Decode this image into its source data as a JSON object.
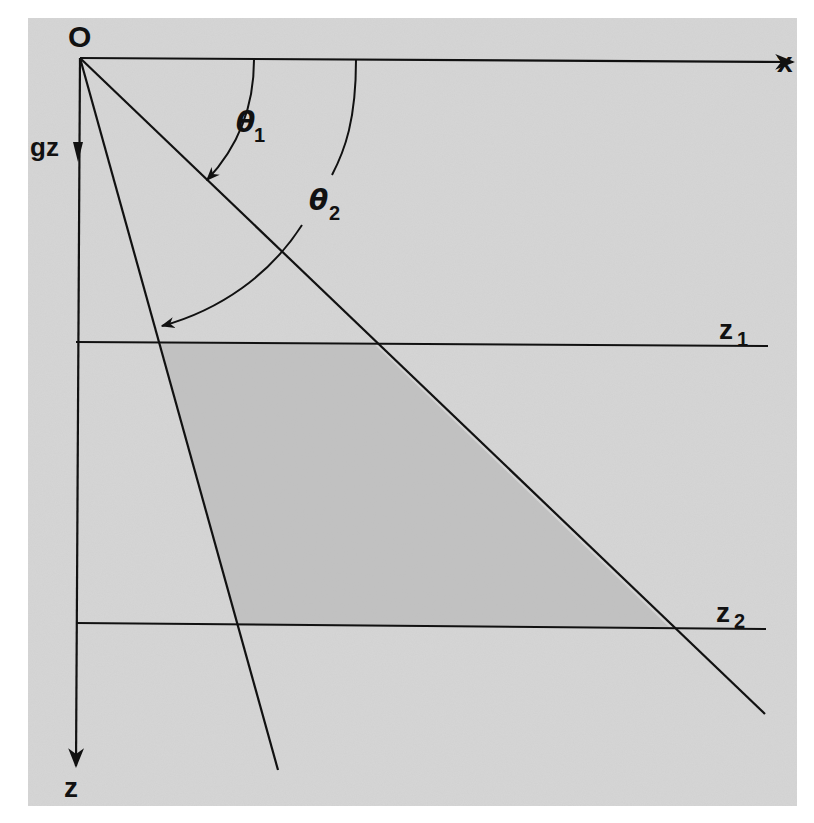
{
  "figure": {
    "type": "geometric-diagram",
    "colors": {
      "paper": "#d6d6d6",
      "shaded_region": "#bdbdbd",
      "ink": "#111111",
      "background": "#ffffff"
    },
    "labels": {
      "origin": "O",
      "x_axis": "x",
      "gravity": "gz",
      "z_axis": "z",
      "depth1_main": "z",
      "depth1_sub": "1",
      "depth2_main": "z",
      "depth2_sub": "2",
      "angle1_main": "θ",
      "angle1_sub": "1",
      "angle2_main": "θ",
      "angle2_sub": "2"
    },
    "geometry": {
      "origin_px": [
        80,
        58
      ],
      "x_axis_end_px": [
        795,
        62
      ],
      "z_axis_end_px": [
        76,
        768
      ],
      "ray1_end_px": [
        765,
        714
      ],
      "ray2_end_px": [
        278,
        770
      ],
      "z1_line_y_px": 344,
      "z2_line_y_px": 627,
      "shaded_polygon_px": [
        [
          160,
          343
        ],
        [
          375,
          345
        ],
        [
          670,
          628
        ],
        [
          237,
          626
        ]
      ]
    }
  }
}
